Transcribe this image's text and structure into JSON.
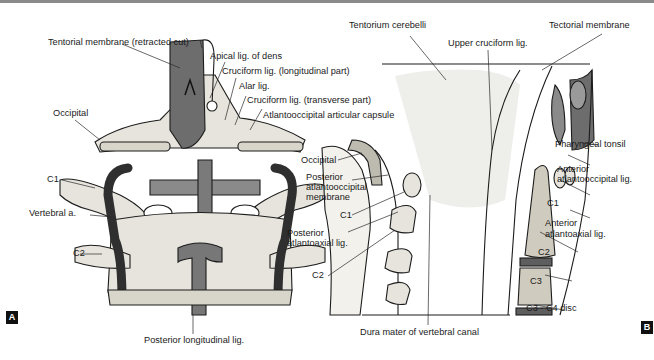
{
  "figure": {
    "panels": [
      {
        "id": "A",
        "tag": "A",
        "view": "posterior view, craniovertebral ligaments",
        "labels": {
          "tentorial_membrane": "Tentorial membrane (retracted cut)",
          "apical_lig": "Apical lig. of dens",
          "cruciform_long": "Cruciform lig. (longitudinal part)",
          "alar_lig": "Alar lig.",
          "cruciform_trans": "Cruciform lig. (transverse part)",
          "atlantooccipital_capsule": "Atlantooccipital articular capsule",
          "occipital": "Occipital",
          "c1": "C1",
          "vertebral_a": "Vertebral a.",
          "c2": "C2",
          "posterior_longitudinal": "Posterior longitudinal lig."
        }
      },
      {
        "id": "B",
        "tag": "B",
        "view": "midsagittal section",
        "labels": {
          "tentorium_cerebelli": "Tentorium cerebelli",
          "tectorial_membrane": "Tectorial membrane",
          "upper_cruciform": "Upper cruciform lig.",
          "pharyngeal_tonsil": "Pharyngeal tonsil",
          "occipital": "Occipital",
          "posterior_aom_1": "Posterior",
          "posterior_aom_2": "atlantooccipital",
          "posterior_aom_3": "membrane",
          "anterior_aol_1": "Anterior",
          "anterior_aol_2": "atlantooccipital lig.",
          "c1_left": "C1",
          "c1_right": "C1",
          "posterior_aal_1": "Posterior",
          "posterior_aal_2": "atlantoaxial lig.",
          "anterior_aal_1": "Anterior",
          "anterior_aal_2": "atlantoaxial lig.",
          "c2_left": "C2",
          "c2_right": "C2",
          "c3": "C3",
          "c3_c4_disc": "C3 - C4 disc",
          "dura_mater": "Dura mater of vertebral canal"
        }
      }
    ]
  },
  "colors": {
    "bone": "#e6e4dc",
    "bone_shade": "#c9c6bb",
    "ligament": "#6d6d6d",
    "artery": "#3b3b3b",
    "outline": "#1c1c1c",
    "tag_bg": "#111111",
    "rule": "#8a8a8a"
  }
}
